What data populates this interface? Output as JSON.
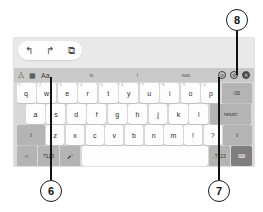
{
  "figure": {
    "type": "on-screen-keyboard-callout-diagram",
    "callouts": [
      {
        "id": "callout-6",
        "label": "6",
        "points_to": "text-style-aa-icon"
      },
      {
        "id": "callout-7",
        "label": "7",
        "points_to": "settings-gear-icon"
      },
      {
        "id": "callout-8",
        "label": "8",
        "points_to": "close-keyboard-icon"
      }
    ]
  },
  "edit_toolbar": {
    "undo_icon": "↰",
    "redo_icon": "↱",
    "copy_icon": "⧉"
  },
  "suggestion_bar": {
    "left_icons": [
      {
        "name": "sticker-icon",
        "glyph": "⧊"
      },
      {
        "name": "grid-keyboard-icon",
        "glyph": "▦"
      },
      {
        "name": "text-style-aa-icon",
        "glyph": "Aa"
      }
    ],
    "suggestions": [
      "is",
      "I",
      "was"
    ],
    "right_icons": [
      {
        "name": "block-icon",
        "glyph": "⊘"
      },
      {
        "name": "settings-gear-icon",
        "glyph": "⚙"
      },
      {
        "name": "close-keyboard-icon",
        "glyph": "✕"
      }
    ]
  },
  "keyboard": {
    "row1": [
      {
        "key": "q",
        "alt": "1"
      },
      {
        "key": "w",
        "alt": "2"
      },
      {
        "key": "e",
        "alt": "3"
      },
      {
        "key": "r",
        "alt": "4"
      },
      {
        "key": "t",
        "alt": "5"
      },
      {
        "key": "y",
        "alt": "6"
      },
      {
        "key": "u",
        "alt": "7"
      },
      {
        "key": "i",
        "alt": "8"
      },
      {
        "key": "o",
        "alt": "9"
      },
      {
        "key": "p",
        "alt": "0"
      }
    ],
    "backspace_label": "⌫",
    "row2": [
      {
        "key": "a"
      },
      {
        "key": "s"
      },
      {
        "key": "d"
      },
      {
        "key": "f"
      },
      {
        "key": "g"
      },
      {
        "key": "h"
      },
      {
        "key": "j"
      },
      {
        "key": "k"
      },
      {
        "key": "l"
      }
    ],
    "return_label": "return",
    "row3": [
      {
        "key": "z"
      },
      {
        "key": "x"
      },
      {
        "key": "c"
      },
      {
        "key": "v"
      },
      {
        "key": "b"
      },
      {
        "key": "n"
      },
      {
        "key": "m"
      }
    ],
    "shift_left_label": "⇧",
    "shift_right_label": "⇧",
    "punct_exclaim": "!",
    "punct_exclaim_sub": ",",
    "punct_question": "?",
    "punct_question_sub": ".",
    "row4": {
      "emoji_label": "☺",
      "numeric_left_label": "?123",
      "mic_label": "🎤",
      "space_label": "",
      "numeric_right_label": ".?123",
      "hide_keyboard_label": "⌨"
    }
  },
  "colors": {
    "panel_bg": "#d8d8d8",
    "edit_strip_bg": "#e9e9e9",
    "suggest_bg": "#c9c9c9",
    "key_bg": "#fdfdfd",
    "key_dark_bg": "#b4b4b4",
    "key_darker_bg": "#7f7f7f",
    "callout_stroke": "#1a1a1a"
  }
}
